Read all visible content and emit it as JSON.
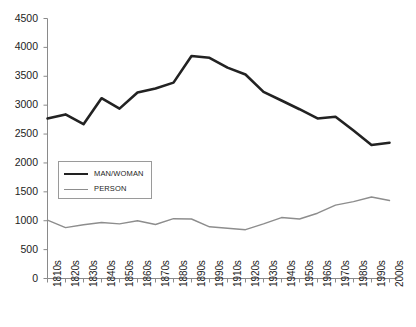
{
  "chart_data": {
    "type": "line",
    "title": "",
    "subtitle": "",
    "xlabel": "",
    "ylabel": "",
    "grid": false,
    "legend_position": "inside-left",
    "ylim": [
      0,
      4500
    ],
    "ytick_step": 500,
    "ytick_labels": [
      "0",
      "500",
      "1000",
      "1500",
      "2000",
      "2500",
      "3000",
      "3500",
      "4000",
      "4500"
    ],
    "ytick_values": [
      0,
      500,
      1000,
      1500,
      2000,
      2500,
      3000,
      3500,
      4000,
      4500
    ],
    "categories": [
      "1810s",
      "1820s",
      "1830s",
      "1840s",
      "1850s",
      "1860s",
      "1870s",
      "1880s",
      "1890s",
      "1990s",
      "1910s",
      "1920s",
      "1930s",
      "1940s",
      "1950s",
      "1960s",
      "1970s",
      "1980s",
      "1990s",
      "2000s"
    ],
    "series": [
      {
        "name": "MAN/WOMAN",
        "color": "#222222",
        "width": 2.6,
        "values": [
          2770,
          2840,
          2670,
          3120,
          2940,
          3220,
          3290,
          3390,
          3850,
          3820,
          3650,
          3530,
          3230,
          3080,
          2930,
          2770,
          2800,
          2560,
          2310,
          2350
        ]
      },
      {
        "name": "PERSON",
        "color": "#8d8d8d",
        "width": 1.4,
        "values": [
          1010,
          880,
          930,
          970,
          945,
          1000,
          935,
          1035,
          1030,
          895,
          870,
          845,
          945,
          1055,
          1030,
          1130,
          1270,
          1330,
          1410,
          1350
        ]
      }
    ]
  },
  "axis": {
    "line_color": "#8a8a8a",
    "tick_color": "#8a8a8a"
  },
  "legend": {
    "items": [
      {
        "label": "MAN/WOMAN"
      },
      {
        "label": "PERSON"
      }
    ]
  }
}
